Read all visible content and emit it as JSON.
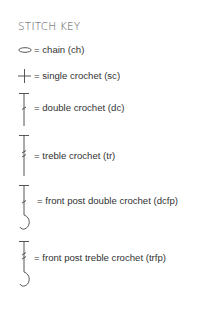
{
  "title": "STITCH KEY",
  "stitches": [
    {
      "icon": "chain-oval-icon",
      "label": "= chain (ch)"
    },
    {
      "icon": "single-crochet-cross-icon",
      "label": "= single crochet (sc)"
    },
    {
      "icon": "double-crochet-icon",
      "label": "= double crochet (dc)"
    },
    {
      "icon": "treble-crochet-icon",
      "label": "= treble crochet (tr)"
    },
    {
      "icon": "front-post-double-crochet-icon",
      "label": "= front post double crochet (dcfp)"
    },
    {
      "icon": "front-post-treble-crochet-icon",
      "label": "= front post treble crochet (trfp)"
    }
  ],
  "colors": {
    "text": "#333333",
    "title": "#555555",
    "symbol": "#444444"
  }
}
